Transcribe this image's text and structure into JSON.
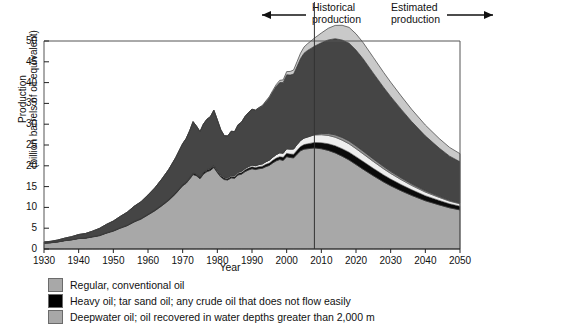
{
  "annotations": {
    "historical": "Historical\nproduction",
    "estimated": "Estimated\nproduction",
    "divider_year": 2008
  },
  "legend": {
    "items": [
      {
        "label": "Regular, conventional oil",
        "color": "#a8a8a8",
        "icon": "legend-swatch-icon"
      },
      {
        "label": "Heavy oil; tar sand oil; any crude oil that does not flow easily",
        "color": "#000000",
        "icon": "legend-swatch-icon"
      },
      {
        "label": "Deepwater oil; oil recovered in water depths greater than 2,000 m",
        "color": "#a8a8a8",
        "icon": "legend-swatch-icon"
      }
    ]
  },
  "chart_data": {
    "type": "area",
    "title": "",
    "xlabel": "Year",
    "ylabel": "Production\n(billion barrels of oil equivalent)",
    "ylabel_line1": "Production",
    "ylabel_line2": "(billion barrels of oil equivalent)",
    "xlim": [
      1930,
      2050
    ],
    "ylim": [
      0,
      50
    ],
    "xticks": [
      1930,
      1940,
      1950,
      1960,
      1970,
      1980,
      1990,
      2000,
      2010,
      2020,
      2030,
      2040,
      2050
    ],
    "yticks": [
      0,
      5,
      10,
      15,
      20,
      25,
      30,
      35,
      40,
      45,
      50
    ],
    "grid": false,
    "legend_position": "below",
    "stacked": true,
    "x": [
      1930,
      1932,
      1934,
      1936,
      1938,
      1940,
      1942,
      1944,
      1946,
      1948,
      1950,
      1952,
      1954,
      1956,
      1958,
      1960,
      1962,
      1964,
      1966,
      1968,
      1970,
      1971,
      1972,
      1973,
      1974,
      1975,
      1976,
      1977,
      1978,
      1979,
      1980,
      1981,
      1982,
      1983,
      1984,
      1985,
      1986,
      1987,
      1988,
      1989,
      1990,
      1991,
      1992,
      1993,
      1994,
      1995,
      1996,
      1997,
      1998,
      1999,
      2000,
      2001,
      2002,
      2003,
      2004,
      2005,
      2006,
      2007,
      2008,
      2010,
      2012,
      2014,
      2016,
      2018,
      2020,
      2022,
      2025,
      2028,
      2030,
      2033,
      2036,
      2040,
      2044,
      2047,
      2050
    ],
    "series": [
      {
        "name": "Regular, conventional oil",
        "color": "#a8a8a8",
        "values": [
          1.4,
          1.5,
          1.7,
          2.0,
          2.2,
          2.5,
          2.6,
          2.9,
          3.2,
          3.8,
          4.3,
          5.0,
          5.6,
          6.5,
          7.2,
          8.2,
          9.2,
          10.4,
          11.7,
          13.3,
          15.2,
          15.8,
          16.8,
          17.9,
          17.6,
          16.9,
          18.0,
          18.6,
          18.9,
          19.6,
          18.4,
          17.3,
          16.7,
          16.6,
          17.1,
          17.0,
          17.8,
          18.0,
          18.6,
          19.0,
          19.3,
          19.1,
          19.3,
          19.4,
          19.8,
          20.1,
          20.7,
          21.2,
          21.5,
          21.3,
          22.2,
          22.0,
          21.9,
          22.8,
          23.6,
          24.0,
          24.1,
          24.2,
          24.3,
          24.1,
          23.7,
          23.1,
          22.3,
          21.4,
          20.3,
          19.2,
          17.6,
          16.1,
          15.2,
          14.0,
          12.9,
          11.6,
          10.6,
          9.9,
          9.4
        ]
      },
      {
        "name": "Heavy oil; tar sand oil; any crude oil that does not flow easily",
        "color": "#0a0a0a",
        "values": [
          0.05,
          0.05,
          0.06,
          0.06,
          0.07,
          0.08,
          0.08,
          0.09,
          0.1,
          0.11,
          0.12,
          0.13,
          0.14,
          0.16,
          0.17,
          0.19,
          0.21,
          0.23,
          0.25,
          0.28,
          0.3,
          0.32,
          0.34,
          0.36,
          0.36,
          0.35,
          0.37,
          0.38,
          0.39,
          0.4,
          0.38,
          0.37,
          0.36,
          0.36,
          0.38,
          0.38,
          0.4,
          0.41,
          0.43,
          0.45,
          0.47,
          0.48,
          0.5,
          0.52,
          0.55,
          0.58,
          0.62,
          0.66,
          0.7,
          0.74,
          0.8,
          0.84,
          0.88,
          0.95,
          1.02,
          1.1,
          1.18,
          1.25,
          1.32,
          1.45,
          1.6,
          1.72,
          1.82,
          1.88,
          1.9,
          1.88,
          1.8,
          1.7,
          1.62,
          1.5,
          1.38,
          1.22,
          1.08,
          0.98,
          0.9
        ]
      },
      {
        "name": "Deepwater oil; oil recovered in water depths greater than 2,000 m",
        "color": "#eeeeee",
        "values": [
          0.0,
          0.0,
          0.0,
          0.0,
          0.0,
          0.0,
          0.0,
          0.0,
          0.0,
          0.0,
          0.0,
          0.0,
          0.0,
          0.0,
          0.0,
          0.0,
          0.0,
          0.0,
          0.0,
          0.0,
          0.02,
          0.03,
          0.04,
          0.05,
          0.06,
          0.07,
          0.09,
          0.11,
          0.13,
          0.15,
          0.16,
          0.17,
          0.18,
          0.2,
          0.22,
          0.24,
          0.27,
          0.3,
          0.33,
          0.37,
          0.41,
          0.45,
          0.5,
          0.55,
          0.61,
          0.68,
          0.76,
          0.84,
          0.92,
          1.0,
          1.1,
          1.18,
          1.26,
          1.36,
          1.46,
          1.56,
          1.64,
          1.72,
          1.8,
          1.92,
          2.0,
          2.05,
          2.05,
          2.0,
          1.92,
          1.82,
          1.64,
          1.46,
          1.34,
          1.18,
          1.02,
          0.86,
          0.72,
          0.62,
          0.56
        ]
      },
      {
        "name": "Natural gas liquids and other liquids",
        "color": "#8f8f8f",
        "values": [
          0.0,
          0.0,
          0.0,
          0.0,
          0.0,
          0.0,
          0.0,
          0.0,
          0.0,
          0.0,
          0.0,
          0.0,
          0.0,
          0.0,
          0.0,
          0.0,
          0.0,
          0.0,
          0.0,
          0.0,
          0.0,
          0.0,
          0.0,
          0.0,
          0.0,
          0.0,
          0.0,
          0.0,
          0.0,
          0.0,
          0.0,
          0.0,
          0.0,
          0.0,
          0.0,
          0.0,
          0.0,
          0.0,
          0.0,
          0.0,
          0.0,
          0.0,
          0.0,
          0.0,
          0.0,
          0.0,
          0.0,
          0.0,
          0.0,
          0.0,
          0.0,
          0.0,
          0.0,
          0.0,
          0.0,
          0.0,
          0.0,
          0.05,
          0.12,
          0.3,
          0.46,
          0.58,
          0.66,
          0.7,
          0.7,
          0.68,
          0.62,
          0.56,
          0.5,
          0.44,
          0.38,
          0.32,
          0.26,
          0.22,
          0.2
        ]
      },
      {
        "name": "Unconventional gas and coal-derived liquids",
        "color": "#454545",
        "values": [
          0.25,
          0.3,
          0.4,
          0.55,
          0.7,
          0.9,
          1.05,
          1.3,
          1.65,
          2.0,
          2.3,
          2.7,
          3.1,
          3.6,
          4.0,
          4.6,
          5.3,
          6.2,
          7.2,
          8.4,
          9.8,
          10.4,
          11.2,
          12.3,
          11.5,
          10.9,
          11.6,
          12.1,
          12.4,
          13.2,
          12.1,
          10.8,
          10.0,
          10.0,
          10.6,
          10.6,
          11.4,
          11.8,
          12.5,
          13.0,
          13.4,
          13.3,
          13.6,
          13.9,
          14.4,
          15.0,
          15.7,
          16.4,
          16.9,
          17.0,
          17.8,
          17.8,
          18.0,
          18.8,
          19.7,
          20.4,
          20.8,
          21.0,
          21.2,
          21.8,
          22.5,
          23.1,
          23.4,
          23.5,
          23.0,
          22.2,
          20.6,
          19.0,
          18.0,
          16.5,
          15.0,
          13.2,
          11.6,
          10.6,
          9.9
        ]
      },
      {
        "name": "Biofuels and other liquids",
        "color": "#c9c9c9",
        "values": [
          0.0,
          0.0,
          0.0,
          0.0,
          0.0,
          0.0,
          0.0,
          0.0,
          0.0,
          0.0,
          0.0,
          0.0,
          0.0,
          0.0,
          0.0,
          0.0,
          0.0,
          0.0,
          0.0,
          0.0,
          0.0,
          0.0,
          0.0,
          0.0,
          0.0,
          0.0,
          0.0,
          0.0,
          0.0,
          0.0,
          0.0,
          0.0,
          0.0,
          0.0,
          0.0,
          0.0,
          0.0,
          0.0,
          0.0,
          0.0,
          0.05,
          0.08,
          0.12,
          0.16,
          0.22,
          0.28,
          0.35,
          0.44,
          0.52,
          0.62,
          0.74,
          0.86,
          0.98,
          1.14,
          1.3,
          1.48,
          1.62,
          1.78,
          1.95,
          2.35,
          2.8,
          3.2,
          3.55,
          3.8,
          3.9,
          3.9,
          3.8,
          3.6,
          3.45,
          3.2,
          2.95,
          2.6,
          2.3,
          2.1,
          1.95
        ]
      }
    ]
  }
}
